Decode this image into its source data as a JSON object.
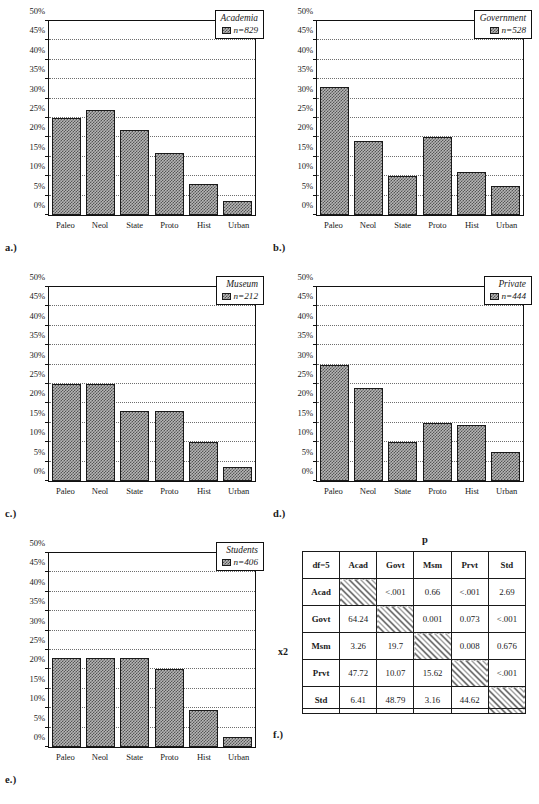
{
  "figure": {
    "categories": [
      "Paleo",
      "Neol",
      "State",
      "Proto",
      "Hist",
      "Urban"
    ],
    "yticks": [
      "0%",
      "5%",
      "10%",
      "15%",
      "20%",
      "25%",
      "30%",
      "35%",
      "40%",
      "45%",
      "50%"
    ]
  },
  "panels": [
    {
      "key": "a",
      "label": "a.)",
      "legend_title": "Academia",
      "legend_n": "n=829"
    },
    {
      "key": "b",
      "label": "b.)",
      "legend_title": "Government",
      "legend_n": "n=528"
    },
    {
      "key": "c",
      "label": "c.)",
      "legend_title": "Museum",
      "legend_n": "n=212"
    },
    {
      "key": "d",
      "label": "d.)",
      "legend_title": "Private",
      "legend_n": "n=444"
    },
    {
      "key": "e",
      "label": "e.)",
      "legend_title": "Students",
      "legend_n": "n=406"
    },
    {
      "key": "f",
      "label": "f.)"
    }
  ],
  "chart_data": [
    {
      "type": "bar",
      "title": "Academia",
      "annotation": "n=829",
      "panel": "a.)",
      "categories": [
        "Paleo",
        "Neol",
        "State",
        "Proto",
        "Hist",
        "Urban"
      ],
      "values": [
        25.0,
        27.0,
        22.0,
        16.0,
        8.0,
        3.5
      ],
      "xlabel": "",
      "ylabel": "",
      "ylim": [
        0,
        50
      ],
      "ytick_step": 5,
      "grid": true,
      "legend_position": "top-right"
    },
    {
      "type": "bar",
      "title": "Government",
      "annotation": "n=528",
      "panel": "b.)",
      "categories": [
        "Paleo",
        "Neol",
        "State",
        "Proto",
        "Hist",
        "Urban"
      ],
      "values": [
        33.0,
        19.0,
        10.0,
        20.0,
        11.0,
        7.5
      ],
      "xlabel": "",
      "ylabel": "",
      "ylim": [
        0,
        50
      ],
      "ytick_step": 5,
      "grid": true,
      "legend_position": "top-right"
    },
    {
      "type": "bar",
      "title": "Museum",
      "annotation": "n=212",
      "panel": "c.)",
      "categories": [
        "Paleo",
        "Neol",
        "State",
        "Proto",
        "Hist",
        "Urban"
      ],
      "values": [
        25.0,
        25.0,
        18.0,
        18.0,
        10.0,
        3.5
      ],
      "xlabel": "",
      "ylabel": "",
      "ylim": [
        0,
        50
      ],
      "ytick_step": 5,
      "grid": true,
      "legend_position": "top-right"
    },
    {
      "type": "bar",
      "title": "Private",
      "annotation": "n=444",
      "panel": "d.)",
      "categories": [
        "Paleo",
        "Neol",
        "State",
        "Proto",
        "Hist",
        "Urban"
      ],
      "values": [
        30.0,
        24.0,
        10.0,
        15.0,
        14.5,
        7.5
      ],
      "xlabel": "",
      "ylabel": "",
      "ylim": [
        0,
        50
      ],
      "ytick_step": 5,
      "grid": true,
      "legend_position": "top-right"
    },
    {
      "type": "bar",
      "title": "Students",
      "annotation": "n=406",
      "panel": "e.)",
      "categories": [
        "Paleo",
        "Neol",
        "State",
        "Proto",
        "Hist",
        "Urban"
      ],
      "values": [
        23.0,
        23.0,
        23.0,
        20.0,
        9.5,
        2.5
      ],
      "xlabel": "",
      "ylabel": "",
      "ylim": [
        0,
        50
      ],
      "ytick_step": 5,
      "grid": true,
      "legend_position": "top-right"
    },
    {
      "type": "table",
      "panel": "f.)",
      "title": "p",
      "row_axis_label": "x2",
      "columns": [
        "df=5",
        "Acad",
        "Govt",
        "Msm",
        "Prvt",
        "Std"
      ],
      "rows": [
        {
          "header": "Acad",
          "cells": [
            "",
            "<.001",
            "0.66",
            "<.001",
            "2.69"
          ]
        },
        {
          "header": "Govt",
          "cells": [
            "64.24",
            "",
            "0.001",
            "0.073",
            "<.001"
          ]
        },
        {
          "header": "Msm",
          "cells": [
            "3.26",
            "19.7",
            "",
            "0.008",
            "0.676"
          ]
        },
        {
          "header": "Prvt",
          "cells": [
            "47.72",
            "10.07",
            "15.62",
            "",
            "<.001"
          ]
        },
        {
          "header": "Std",
          "cells": [
            "6.41",
            "48.79",
            "3.16",
            "44.62",
            ""
          ]
        }
      ],
      "diagonal_blank": true
    }
  ]
}
